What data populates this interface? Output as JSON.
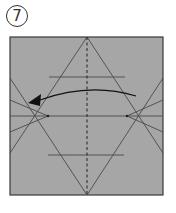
{
  "step": {
    "number": "7",
    "label": "⑦"
  },
  "diagram": {
    "paper_color": "#a6a6a6",
    "line_color": "#4a4a4a",
    "arrow_color": "#111111",
    "square": {
      "x": 10,
      "y": 37,
      "w": 153,
      "h": 158
    },
    "fold_action": "fold right edge to left (valley fold along center)"
  }
}
